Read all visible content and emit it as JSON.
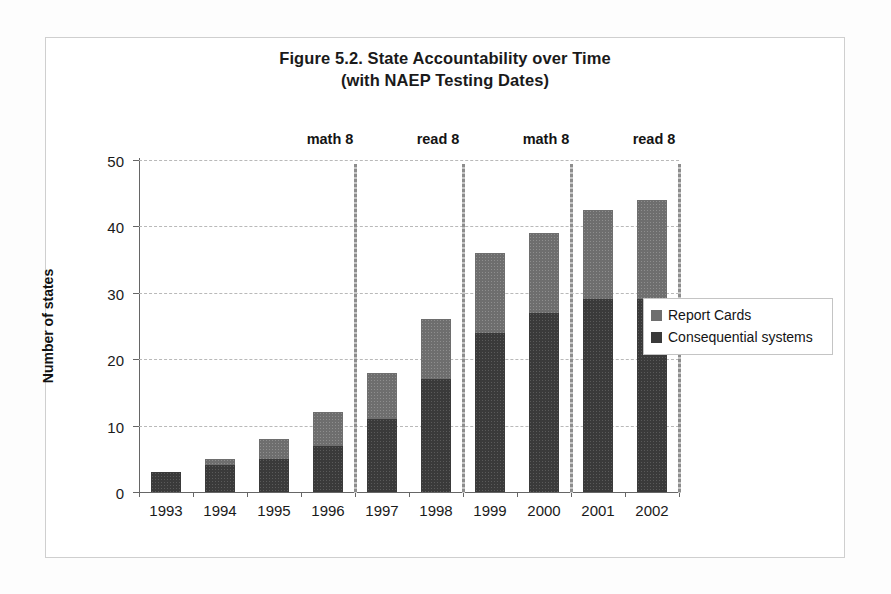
{
  "figure": {
    "title_line1": "Figure 5.2. State Accountability over Time",
    "title_line2": "(with NAEP Testing Dates)"
  },
  "chart_data": {
    "type": "bar",
    "subtype": "stacked-vertical",
    "title": "Figure 5.2. State Accountability over Time (with NAEP Testing Dates)",
    "xlabel": "",
    "ylabel": "Number of states",
    "ylim": [
      0,
      50
    ],
    "ytick_step": 10,
    "ytick_labels": [
      "0",
      "10",
      "20",
      "30",
      "40",
      "50"
    ],
    "ytick_values": [
      0,
      10,
      20,
      30,
      40,
      50
    ],
    "grid": "horizontal-dashed",
    "legend_position": "right-middle",
    "categories": [
      "1993",
      "1994",
      "1995",
      "1996",
      "1997",
      "1998",
      "1999",
      "2000",
      "2001",
      "2002"
    ],
    "series": [
      {
        "name": "Consequential systems",
        "color": "#3a3a3a",
        "values": [
          3,
          4,
          5,
          7,
          11,
          17,
          24,
          27,
          29,
          29
        ]
      },
      {
        "name": "Report Cards",
        "color": "#6e6e6e",
        "values": [
          0,
          1,
          3,
          5,
          7,
          9,
          12,
          12,
          13.5,
          15
        ]
      }
    ],
    "totals": [
      3,
      5,
      8,
      12,
      18,
      26,
      36,
      39,
      42.5,
      44
    ],
    "annotations": [
      {
        "label": "math 8",
        "after_category": "1996",
        "kind": "vertical-line"
      },
      {
        "label": "read 8",
        "after_category": "1998",
        "kind": "vertical-line"
      },
      {
        "label": "math 8",
        "after_category": "2000",
        "kind": "vertical-line"
      },
      {
        "label": "read 8",
        "after_category": "2002",
        "kind": "vertical-line"
      }
    ]
  },
  "legend": {
    "items": [
      {
        "label": "Report Cards",
        "color": "#6e6e6e"
      },
      {
        "label": "Consequential systems",
        "color": "#3a3a3a"
      }
    ]
  },
  "colors": {
    "report_cards": "#6e6e6e",
    "consequential_systems": "#3a3a3a",
    "gridline": "#b9b9b9",
    "axis": "#666666",
    "naep_line": "#9a9a9a",
    "frame": "#cfcfcf"
  }
}
